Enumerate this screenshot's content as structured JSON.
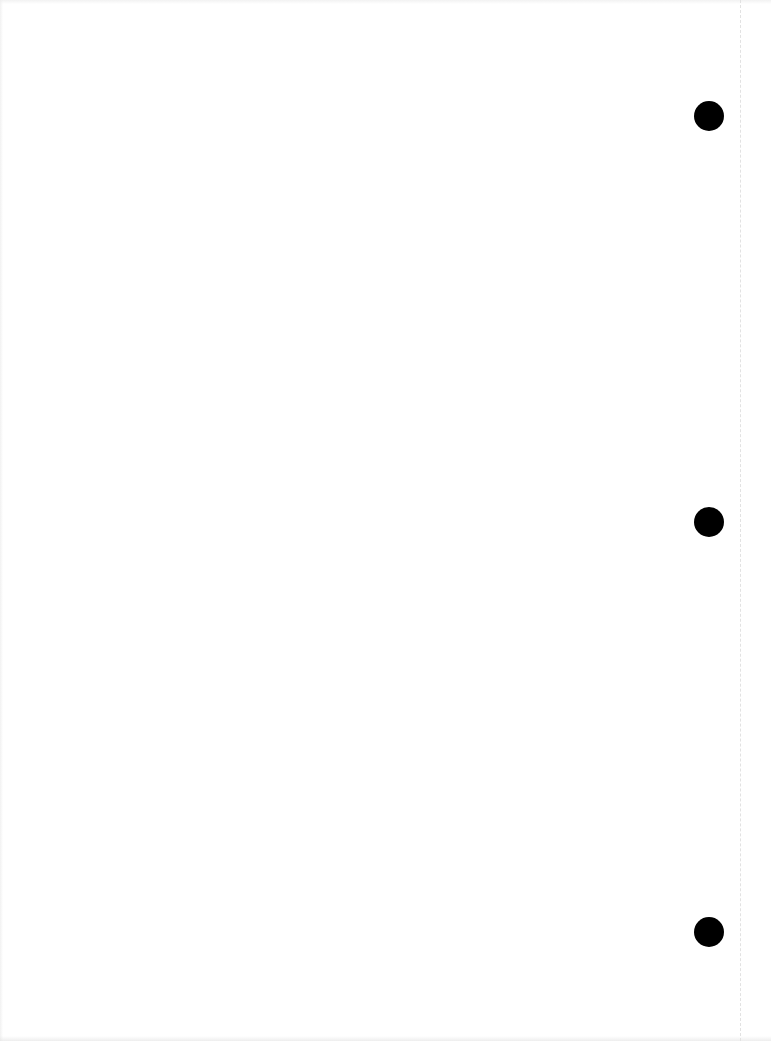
{
  "document": {
    "type": "scanned-blank-page",
    "background_color": "#ffffff",
    "text_content": "",
    "punch_holes": [
      {
        "name": "punch-hole-top",
        "cx": 709,
        "cy": 116,
        "diameter": 30,
        "color": "#000000"
      },
      {
        "name": "punch-hole-middle",
        "cx": 709,
        "cy": 522,
        "diameter": 30,
        "color": "#000000"
      },
      {
        "name": "punch-hole-bottom",
        "cx": 709,
        "cy": 932,
        "diameter": 30,
        "color": "#000000"
      }
    ],
    "fold_line": {
      "x": 740,
      "style": "dashed",
      "color": "#e2e2e2"
    }
  }
}
